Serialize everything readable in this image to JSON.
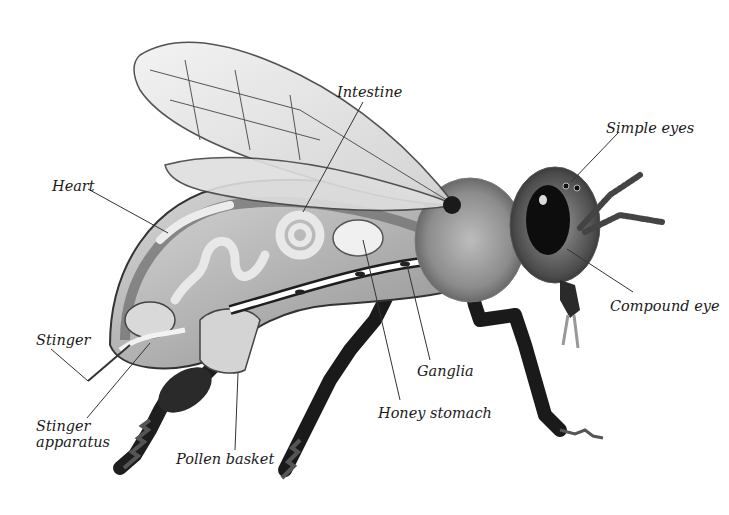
{
  "diagram": {
    "colors": {
      "background": "#ffffff",
      "ink": "#1a1a1a",
      "leader_line": "#333333",
      "body_dark": "#2a2a2a",
      "body_mid": "#8a8a8a",
      "body_light": "#c8c8c8",
      "wing": "#e6e6e6"
    },
    "labels": [
      {
        "id": "intestine",
        "text": "Intestine",
        "x": 337,
        "y": 84,
        "line": [
          [
            363,
            102
          ],
          [
            303,
            212
          ]
        ]
      },
      {
        "id": "simple-eyes",
        "text": "Simple eyes",
        "x": 606,
        "y": 120,
        "line": [
          [
            618,
            133
          ],
          [
            571,
            182
          ]
        ]
      },
      {
        "id": "heart",
        "text": "Heart",
        "x": 52,
        "y": 178,
        "line": [
          [
            88,
            189
          ],
          [
            168,
            233
          ]
        ]
      },
      {
        "id": "compound-eye",
        "text": "Compound eye",
        "x": 610,
        "y": 298,
        "line": [
          [
            633,
            292
          ],
          [
            567,
            249
          ]
        ]
      },
      {
        "id": "stinger",
        "text": "Stinger",
        "x": 36,
        "y": 332,
        "line": [
          [
            51,
            349
          ],
          [
            88,
            381
          ]
        ]
      },
      {
        "id": "ganglia",
        "text": "Ganglia",
        "x": 417,
        "y": 363,
        "line": [
          [
            430,
            360
          ],
          [
            407,
            265
          ]
        ]
      },
      {
        "id": "stinger-apparatus",
        "text": "Stinger\napparatus",
        "x": 36,
        "y": 418,
        "line": [
          [
            87,
            418
          ],
          [
            150,
            343
          ]
        ]
      },
      {
        "id": "honey-stomach",
        "text": "Honey stomach",
        "x": 378,
        "y": 405,
        "line": [
          [
            400,
            400
          ],
          [
            363,
            240
          ]
        ]
      },
      {
        "id": "pollen-basket",
        "text": "Pollen basket",
        "x": 176,
        "y": 451,
        "line": [
          [
            235,
            450
          ],
          [
            238,
            373
          ]
        ]
      }
    ]
  }
}
